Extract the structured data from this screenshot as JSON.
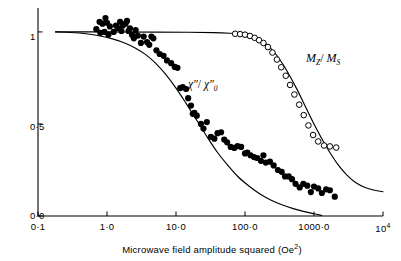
{
  "figure": {
    "background_color": "#ffffff",
    "ink_color": "#000000"
  },
  "axes": {
    "x": {
      "title_text": "Microwave field amplitude squared (Oe",
      "title_sup": "2",
      "title_tail": ")",
      "scale": "log",
      "range": [
        0.1,
        10000
      ],
      "ticks": [
        {
          "value": 0.1,
          "label": "0·1"
        },
        {
          "value": 1,
          "label": "1·0"
        },
        {
          "value": 10,
          "label": "10·0"
        },
        {
          "value": 100,
          "label": "100·0"
        },
        {
          "value": 1000,
          "label": "1000·0"
        },
        {
          "value": 10000,
          "label": "10",
          "sup": "4"
        }
      ]
    },
    "y": {
      "scale": "linear",
      "range": [
        0,
        1.13
      ],
      "ticks": [
        {
          "value": 0,
          "label": "0·0"
        },
        {
          "value": 0.5,
          "label": "0·5"
        },
        {
          "value": 1,
          "label": "1"
        }
      ]
    }
  },
  "curve_labels": {
    "mz_ms": {
      "num": "M",
      "num_sub": "Z",
      "sep": "/ ",
      "den": "M",
      "den_sub": "S"
    },
    "chi": {
      "num": "χ″",
      "sep": "/ ",
      "den": "χ″",
      "den_sub": "0"
    }
  },
  "chart_data": {
    "type": "scatter",
    "title": "",
    "xlabel": "Microwave field amplitude squared (Oe2)",
    "ylabel": "",
    "xscale": "log",
    "xlim": [
      0.1,
      10000
    ],
    "ylim": [
      0.0,
      1.13
    ],
    "grid": false,
    "legend": "inline-annotations",
    "series": [
      {
        "name": "χ″/χ″0 (measured)",
        "marker": "filled-circle",
        "marker_color": "#000000",
        "points": [
          [
            0.7,
            1.015
          ],
          [
            0.78,
            1.055
          ],
          [
            0.8,
            0.995
          ],
          [
            0.86,
            1.045
          ],
          [
            0.92,
            1.0
          ],
          [
            0.95,
            1.075
          ],
          [
            1.0,
            1.05
          ],
          [
            1.05,
            0.985
          ],
          [
            1.1,
            1.03
          ],
          [
            1.25,
            1.0
          ],
          [
            1.35,
            1.035
          ],
          [
            1.45,
            1.02
          ],
          [
            1.55,
            1.055
          ],
          [
            1.62,
            1.005
          ],
          [
            1.7,
            1.035
          ],
          [
            1.85,
            1.045
          ],
          [
            1.95,
            1.06
          ],
          [
            2.05,
            1.005
          ],
          [
            2.15,
            1.02
          ],
          [
            2.3,
            0.985
          ],
          [
            2.45,
            0.965
          ],
          [
            2.6,
            1.01
          ],
          [
            2.8,
            0.98
          ],
          [
            3.1,
            0.94
          ],
          [
            3.4,
            0.975
          ],
          [
            3.8,
            0.945
          ],
          [
            4.1,
            0.93
          ],
          [
            4.4,
            0.975
          ],
          [
            4.7,
            0.965
          ],
          [
            5.2,
            0.9
          ],
          [
            5.8,
            0.88
          ],
          [
            6.6,
            0.87
          ],
          [
            7.4,
            0.845
          ],
          [
            8.5,
            0.83
          ],
          [
            9.6,
            0.81
          ],
          [
            10.5,
            0.805
          ],
          [
            11.5,
            0.695
          ],
          [
            12.5,
            0.7
          ],
          [
            14.0,
            0.69
          ],
          [
            15.0,
            0.64
          ],
          [
            16.5,
            0.6
          ],
          [
            17.5,
            0.555
          ],
          [
            18.5,
            0.56
          ],
          [
            20.0,
            0.545
          ],
          [
            23.0,
            0.5
          ],
          [
            25.0,
            0.475
          ],
          [
            28.0,
            0.51
          ],
          [
            32.0,
            0.43
          ],
          [
            36.0,
            0.42
          ],
          [
            40.0,
            0.45
          ],
          [
            45.0,
            0.455
          ],
          [
            50.0,
            0.415
          ],
          [
            55.0,
            0.4
          ],
          [
            62.0,
            0.375
          ],
          [
            70.0,
            0.37
          ],
          [
            78.0,
            0.38
          ],
          [
            88.0,
            0.375
          ],
          [
            100.0,
            0.34
          ],
          [
            108.0,
            0.345
          ],
          [
            120.0,
            0.33
          ],
          [
            135.0,
            0.32
          ],
          [
            150.0,
            0.315
          ],
          [
            170.0,
            0.3
          ],
          [
            185.0,
            0.33
          ],
          [
            200.0,
            0.29
          ],
          [
            230.0,
            0.295
          ],
          [
            260.0,
            0.275
          ],
          [
            300.0,
            0.25
          ],
          [
            340.0,
            0.24
          ],
          [
            380.0,
            0.215
          ],
          [
            430.0,
            0.215
          ],
          [
            480.0,
            0.2
          ],
          [
            540.0,
            0.175
          ],
          [
            620.0,
            0.155
          ],
          [
            700.0,
            0.175
          ],
          [
            800.0,
            0.165
          ],
          [
            900.0,
            0.13
          ],
          [
            1000.0,
            0.16
          ],
          [
            1150.0,
            0.15
          ],
          [
            1300.0,
            0.125
          ],
          [
            1500.0,
            0.145
          ],
          [
            1700.0,
            0.14
          ],
          [
            2000.0,
            0.105
          ]
        ]
      },
      {
        "name": "Mz/Ms (measured)",
        "marker": "open-circle",
        "marker_color": "#ffffff",
        "points": [
          [
            72,
            0.99
          ],
          [
            85,
            0.988
          ],
          [
            100,
            0.985
          ],
          [
            118,
            0.978
          ],
          [
            138,
            0.968
          ],
          [
            160,
            0.955
          ],
          [
            185,
            0.94
          ],
          [
            215,
            0.918
          ],
          [
            250,
            0.888
          ],
          [
            290,
            0.85
          ],
          [
            335,
            0.808
          ],
          [
            390,
            0.762
          ],
          [
            450,
            0.712
          ],
          [
            520,
            0.66
          ],
          [
            610,
            0.605
          ],
          [
            710,
            0.548
          ],
          [
            830,
            0.492
          ],
          [
            970,
            0.44
          ],
          [
            1150,
            0.405
          ],
          [
            1400,
            0.383
          ],
          [
            1700,
            0.378
          ],
          [
            2100,
            0.372
          ]
        ]
      }
    ],
    "curves": [
      {
        "name": "χ″/χ″0 (theory)",
        "style": "solid",
        "points": [
          [
            0.18,
            1.0
          ],
          [
            0.3,
            0.997
          ],
          [
            0.5,
            0.99
          ],
          [
            0.8,
            0.978
          ],
          [
            1.2,
            0.962
          ],
          [
            1.8,
            0.94
          ],
          [
            2.6,
            0.912
          ],
          [
            3.6,
            0.878
          ],
          [
            5.0,
            0.832
          ],
          [
            7.0,
            0.772
          ],
          [
            10.0,
            0.695
          ],
          [
            14.0,
            0.612
          ],
          [
            20.0,
            0.52
          ],
          [
            28.0,
            0.432
          ],
          [
            40.0,
            0.345
          ],
          [
            55.0,
            0.28
          ],
          [
            80.0,
            0.212
          ],
          [
            115.0,
            0.162
          ],
          [
            165.0,
            0.12
          ],
          [
            240.0,
            0.086
          ],
          [
            350.0,
            0.06
          ],
          [
            500.0,
            0.04
          ],
          [
            700.0,
            0.025
          ],
          [
            1000.0,
            0.012
          ],
          [
            1300.0,
            0.003
          ]
        ]
      },
      {
        "name": "Mz/Ms (theory)",
        "style": "solid",
        "points": [
          [
            0.18,
            1.0
          ],
          [
            1.0,
            1.0
          ],
          [
            5.0,
            0.999
          ],
          [
            15.0,
            0.998
          ],
          [
            35.0,
            0.996
          ],
          [
            60.0,
            0.993
          ],
          [
            80.0,
            0.99
          ],
          [
            110.0,
            0.982
          ],
          [
            140.0,
            0.97
          ],
          [
            180.0,
            0.948
          ],
          [
            230.0,
            0.915
          ],
          [
            290.0,
            0.872
          ],
          [
            360.0,
            0.82
          ],
          [
            450.0,
            0.758
          ],
          [
            560.0,
            0.692
          ],
          [
            700.0,
            0.618
          ],
          [
            870.0,
            0.545
          ],
          [
            1100.0,
            0.47
          ],
          [
            1400.0,
            0.398
          ],
          [
            1800.0,
            0.33
          ],
          [
            2300.0,
            0.272
          ],
          [
            3000.0,
            0.222
          ],
          [
            4000.0,
            0.182
          ],
          [
            5500.0,
            0.155
          ],
          [
            7500.0,
            0.14
          ],
          [
            10000.0,
            0.132
          ]
        ]
      }
    ]
  }
}
